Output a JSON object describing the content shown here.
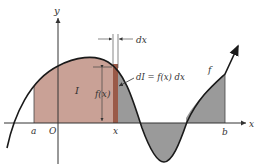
{
  "diagram": {
    "axes": {
      "x_label": "x",
      "y_label": "y",
      "origin_label": "O"
    },
    "points": {
      "a": "a",
      "x": "x",
      "b": "b"
    },
    "labels": {
      "area": "I",
      "height": "f(x)",
      "width": "dx",
      "differential": "dI = f(x) dx",
      "function": "f"
    },
    "colors": {
      "area_fill": "#c9a196",
      "strip_fill": "#9a5a48",
      "shaded_fill": "#9a9a9a",
      "curve": "#1a1a1a",
      "axis": "#333333"
    }
  }
}
